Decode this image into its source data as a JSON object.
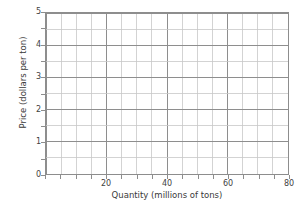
{
  "chart_data": {
    "type": "line",
    "title": "",
    "subtitle": "",
    "xlabel": "Quantity (millions of tons)",
    "ylabel": "Price (dollars per ton)",
    "xlim": [
      0,
      80
    ],
    "ylim": [
      0,
      5
    ],
    "xticks": [
      0,
      20,
      40,
      60,
      80
    ],
    "xtick_labels": [
      "",
      "20",
      "40",
      "60",
      "80"
    ],
    "yticks": [
      0,
      1,
      2,
      3,
      4,
      5
    ],
    "ytick_labels": [
      "0",
      "1",
      "2",
      "3",
      "4",
      "5"
    ],
    "x_minor_step": 5,
    "y_minor_step": 0.5,
    "grid": true,
    "grid_major_color": "#8d8d8d",
    "grid_minor_color": "#c8c8c8",
    "legend": null,
    "series": [],
    "annotations": []
  },
  "figure": {
    "background_color": "#ffffff",
    "axis_color": "#8d8d8d",
    "text_color": "#3a3a3a"
  }
}
